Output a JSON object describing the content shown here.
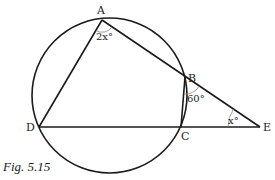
{
  "figure": {
    "caption": "Fig. 5.15",
    "points": {
      "A": {
        "label": "A",
        "x": 102,
        "y": 20
      },
      "B": {
        "label": "B",
        "x": 185,
        "y": 77
      },
      "C": {
        "label": "C",
        "x": 181,
        "y": 127
      },
      "D": {
        "label": "D",
        "x": 39,
        "y": 127
      },
      "E": {
        "label": "E",
        "x": 260,
        "y": 127
      }
    },
    "circle": {
      "cx": 109.5,
      "cy": 95.5,
      "r": 77.5
    },
    "angles": {
      "A": "2x°",
      "B": "60°",
      "E": "x°"
    },
    "segments": [
      "AD",
      "AB",
      "BE",
      "BC",
      "DC",
      "CE"
    ]
  },
  "colors": {
    "stroke": "#1a1a1a",
    "arc": "#888888",
    "background": "#ffffff"
  }
}
